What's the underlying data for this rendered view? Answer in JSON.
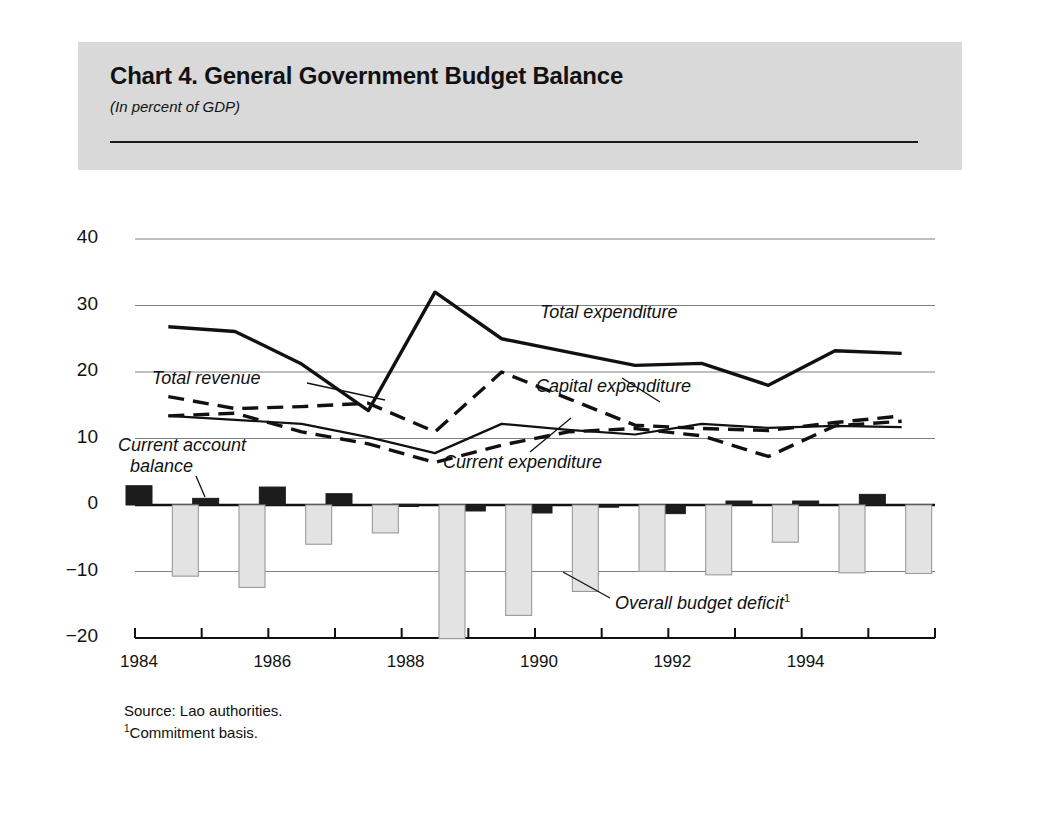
{
  "card": {
    "title": "Chart 4.  General Government Budget Balance",
    "subtitle": "(In percent of GDP)",
    "source": "Source: Lao authorities.",
    "footnote_marker": "1",
    "footnote": "Commitment basis."
  },
  "annotations": {
    "total_revenue": "Total revenue",
    "current_account_balance_l1": "Current account",
    "current_account_balance_l2": "balance",
    "total_expenditure": "Total expenditure",
    "capital_expenditure": "Capital expenditure",
    "current_expenditure": "Current expenditure",
    "overall_budget_deficit": "Overall budget deficit",
    "overall_budget_deficit_marker": "1"
  },
  "colors": {
    "card_bg": "#d9d9d9",
    "panel_bg": "#ffffff",
    "ink": "#111111",
    "gridline": "#808080",
    "bar_dark": "#1c1c1c",
    "bar_light": "#e3e3e3",
    "bar_light_stroke": "#9a9a9a"
  },
  "chart_data": {
    "type": "line",
    "title": "Chart 4.  General Government Budget Balance",
    "subtitle": "(In percent of GDP)",
    "xlabel": "",
    "ylabel": "",
    "ylim": [
      -20,
      40
    ],
    "yticks": [
      40,
      30,
      20,
      10,
      0,
      -10,
      -20
    ],
    "ytick_labels": [
      "40",
      "30",
      "20",
      "10",
      "0",
      "−10",
      "−20"
    ],
    "grid": true,
    "legend_position": "inline-annotations",
    "x": [
      1984,
      1985,
      1986,
      1987,
      1988,
      1989,
      1990,
      1991,
      1992,
      1993,
      1994,
      1995
    ],
    "xticks": [
      1984,
      1985,
      1986,
      1987,
      1988,
      1989,
      1990,
      1991,
      1992,
      1993,
      1994,
      1995
    ],
    "xtick_labels": [
      "1984",
      "",
      "1986",
      "",
      "1988",
      "",
      "1990",
      "",
      "1992",
      "",
      "1994",
      ""
    ],
    "series": [
      {
        "name": "Total expenditure",
        "style": "solid",
        "width": "thick",
        "values": [
          26.8,
          26.1,
          21.2,
          14.2,
          32.0,
          25.0,
          23.0,
          21.0,
          21.3,
          18.0,
          23.2,
          22.8
        ]
      },
      {
        "name": "Total revenue",
        "style": "dashed",
        "width": "thick",
        "values": [
          16.3,
          14.5,
          14.8,
          15.3,
          11.0,
          20.0,
          16.0,
          12.0,
          11.5,
          11.2,
          12.4,
          13.4
        ]
      },
      {
        "name": "Current expenditure",
        "style": "solid",
        "width": "thin",
        "values": [
          13.4,
          12.8,
          12.2,
          10.2,
          7.8,
          12.2,
          11.3,
          10.6,
          12.2,
          11.6,
          11.9,
          11.7
        ]
      },
      {
        "name": "Capital expenditure",
        "style": "dashed",
        "width": "thick",
        "values": [
          13.4,
          13.8,
          11.0,
          9.2,
          6.4,
          9.0,
          11.0,
          11.5,
          10.4,
          7.3,
          11.9,
          12.6
        ]
      }
    ],
    "bar_series": [
      {
        "name": "Current account balance",
        "fill": "dark",
        "values": [
          2.9,
          1.0,
          2.7,
          1.7,
          0.1,
          -0.9,
          -1.2,
          -0.2,
          -1.3,
          0.6,
          0.6,
          1.6
        ]
      },
      {
        "name": "Overall budget deficit",
        "fill": "light",
        "values": [
          -10.7,
          -12.4,
          -5.9,
          -4.2,
          -20.1,
          -16.6,
          -13.0,
          -10.0,
          -10.5,
          -5.6,
          -10.2,
          -10.3
        ]
      }
    ]
  }
}
